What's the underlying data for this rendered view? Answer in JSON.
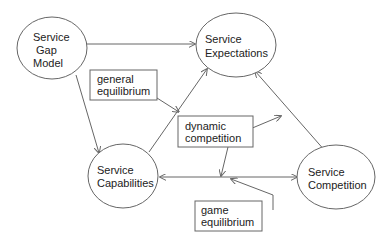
{
  "diagram": {
    "nodes": [
      {
        "id": "gap",
        "shape": "ellipse",
        "lines": [
          "Service",
          "Gap",
          "Model"
        ]
      },
      {
        "id": "exp",
        "shape": "ellipse",
        "lines": [
          "Service",
          "Expectations"
        ]
      },
      {
        "id": "cap",
        "shape": "ellipse",
        "lines": [
          "Service",
          "Capabilities"
        ]
      },
      {
        "id": "comp",
        "shape": "ellipse",
        "lines": [
          "Service",
          "Competition"
        ]
      },
      {
        "id": "gen",
        "shape": "box",
        "lines": [
          "general",
          "equilibrium"
        ]
      },
      {
        "id": "dyn",
        "shape": "box",
        "lines": [
          "dynamic",
          "competition"
        ]
      },
      {
        "id": "game",
        "shape": "box",
        "lines": [
          "game",
          "equilibrium"
        ]
      }
    ],
    "edges": [
      {
        "from": "gap",
        "to": "exp",
        "directed": true
      },
      {
        "from": "gap",
        "to": "cap",
        "directed": true
      },
      {
        "from": "cap",
        "to": "exp",
        "directed": true
      },
      {
        "from": "comp",
        "to": "exp",
        "directed": true
      },
      {
        "from": "cap",
        "to": "comp",
        "directed": "both"
      },
      {
        "from": "gen",
        "to": "cap-exp-edge",
        "directed": true
      },
      {
        "from": "dyn",
        "to": "comp-exp-edge",
        "directed": true
      },
      {
        "from": "dyn",
        "to": "cap-comp-edge",
        "directed": true
      },
      {
        "from": "game",
        "to": "cap-comp-edge",
        "directed": true
      }
    ]
  },
  "colors": {
    "stroke": "#666666",
    "text": "#222222"
  }
}
